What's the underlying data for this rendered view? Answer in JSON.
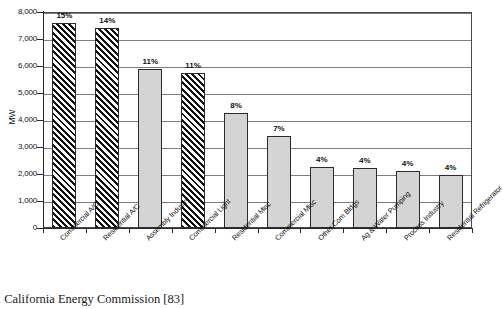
{
  "caption": "e: California Energy Commission [83]",
  "chart_data": {
    "type": "bar",
    "title": "",
    "xlabel": "",
    "ylabel": "MW",
    "ylim": [
      0,
      8000
    ],
    "ytick_labels": [
      "8,000",
      "7,000",
      "6,000",
      "5,000",
      "4,000",
      "3,000",
      "2,000",
      "1,000",
      "0"
    ],
    "ytick_values": [
      8000,
      7000,
      6000,
      5000,
      4000,
      3000,
      2000,
      1000,
      0
    ],
    "grid": true,
    "legend": "none",
    "categories": [
      "Commercial A/C",
      "Residential A/C",
      "Assembly Industry",
      "Commercial Light",
      "Residential Misc",
      "Commercial Misc",
      "Other Com Bldgs",
      "Ag & Water Pumping",
      "Process Industry",
      "Residential Refrigerator"
    ],
    "values": [
      7600,
      7400,
      5900,
      5750,
      4250,
      3400,
      2260,
      2230,
      2100,
      1950
    ],
    "data_labels": [
      "15%",
      "14%",
      "11%",
      "11%",
      "8%",
      "7%",
      "4%",
      "4%",
      "4%",
      "4%"
    ],
    "bar_styles": [
      "hatched",
      "hatched",
      "solid",
      "hatched",
      "solid",
      "solid",
      "solid",
      "solid",
      "solid",
      "solid"
    ],
    "colors": {
      "bar_fill": "#d4d4d4",
      "bar_edge": "#2b2b2b",
      "grid": "#7d7d7d",
      "axis": "#2b2b2b",
      "hatch": "#111111"
    }
  }
}
